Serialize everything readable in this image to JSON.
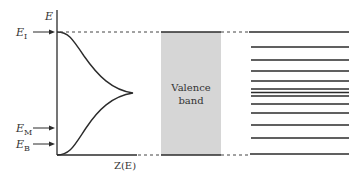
{
  "diagram": {
    "axis": {
      "y_label": "E",
      "x_label": "Z(E)"
    },
    "energy_markers": [
      {
        "id": "EI",
        "base": "E",
        "sub": "I",
        "y": 32
      },
      {
        "id": "EM",
        "base": "E",
        "sub": "M",
        "y": 128
      },
      {
        "id": "EB",
        "base": "E",
        "sub": "B",
        "y": 144
      }
    ],
    "valence_band": {
      "label_line1": "Valence",
      "label_line2": "band",
      "fill": "#d6d6d6"
    },
    "discrete_levels_y": [
      32,
      47,
      60,
      71,
      81,
      89,
      92,
      96,
      104,
      113,
      125,
      138,
      154
    ],
    "colors": {
      "line": "#2b2b2b",
      "text": "#333333",
      "band_fill": "#d6d6d6"
    }
  }
}
